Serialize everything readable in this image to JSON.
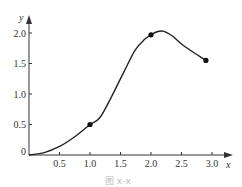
{
  "chart_data": {
    "type": "line",
    "title": "",
    "xlabel": "x",
    "ylabel": "y",
    "xlim": [
      0,
      3.3
    ],
    "ylim": [
      0,
      2.2
    ],
    "grid": false,
    "legend": null,
    "x_ticks": [
      "0.5",
      "1.0",
      "1.5",
      "2.0",
      "2.5",
      "3.0"
    ],
    "y_ticks": [
      "0",
      "0.5",
      "1.0",
      "1.5",
      "2.0"
    ],
    "x_tick_values": [
      0.5,
      1.0,
      1.5,
      2.0,
      2.5,
      3.0
    ],
    "y_tick_values": [
      0,
      0.5,
      1.0,
      1.5,
      2.0
    ],
    "series": [
      {
        "name": "curve",
        "x": [
          0,
          0.25,
          0.5,
          0.75,
          1.0,
          1.16,
          1.35,
          1.55,
          1.74,
          1.9,
          2.0,
          2.1,
          2.2,
          2.35,
          2.5,
          2.7,
          2.9
        ],
        "y": [
          0,
          0.04,
          0.14,
          0.3,
          0.5,
          0.61,
          0.95,
          1.35,
          1.72,
          1.9,
          1.97,
          2.02,
          2.03,
          1.95,
          1.82,
          1.68,
          1.55
        ]
      }
    ],
    "marked_points": [
      {
        "x": 1.0,
        "y": 0.5
      },
      {
        "x": 2.0,
        "y": 1.97
      },
      {
        "x": 2.9,
        "y": 1.55
      }
    ],
    "caption": "图 x-x"
  },
  "colors": {
    "line": "#222222",
    "axis": "#333333",
    "background": "#ffffff"
  }
}
